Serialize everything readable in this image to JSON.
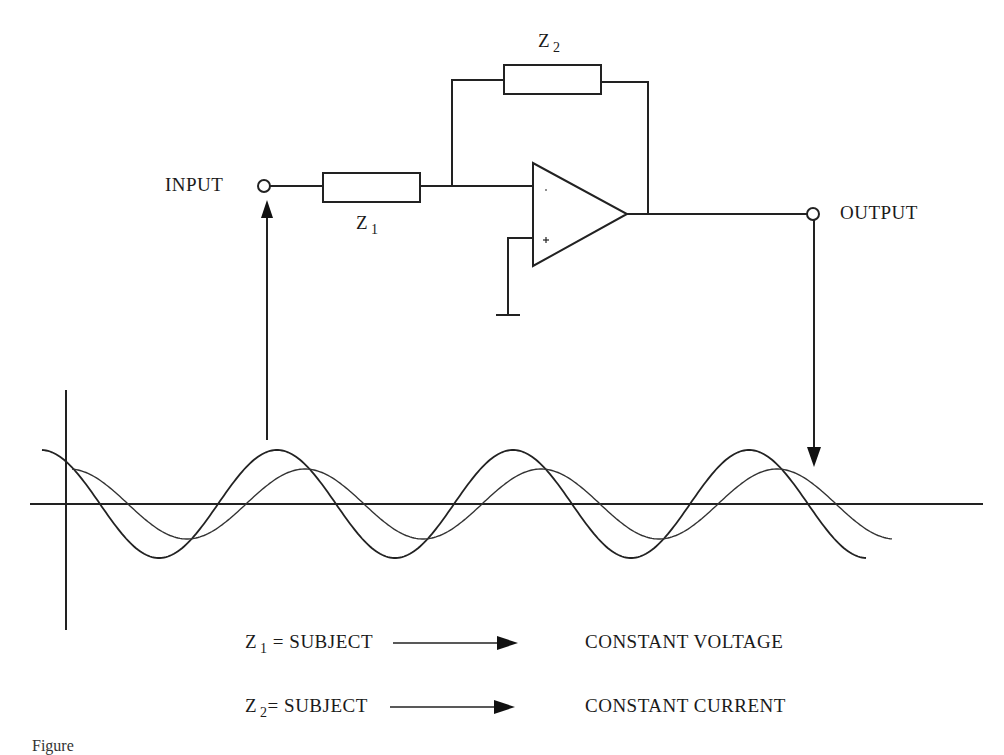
{
  "circuit": {
    "type": "inverting op-amp",
    "input_label": "INPUT",
    "output_label": "OUTPUT",
    "z1": {
      "symbol": "Z",
      "subscript": "1"
    },
    "z2": {
      "symbol": "Z",
      "subscript": "2"
    },
    "opamp": {
      "minus": "-",
      "plus": "+"
    }
  },
  "waveforms": {
    "wave1": {
      "role": "input",
      "amplitude_px": 54,
      "period_px": 236
    },
    "wave2": {
      "role": "output",
      "amplitude_px": 35,
      "period_px": 236,
      "phase_lag_px": 28
    }
  },
  "legend": [
    {
      "z_symbol": "Z",
      "z_subscript": "1",
      "eq": "= SUBJECT",
      "result": "CONSTANT VOLTAGE"
    },
    {
      "z_symbol": "Z",
      "z_subscript": "2",
      "eq": "= SUBJECT",
      "result": "CONSTANT CURRENT"
    }
  ],
  "caption": "Figure"
}
